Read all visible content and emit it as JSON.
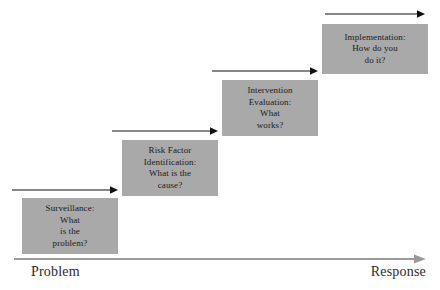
{
  "diagram": {
    "type": "staircase-flow",
    "title": "",
    "box_fill_color": "#a9a9a9",
    "arrow_color": "#111111",
    "axis_color": "#9a9a9a",
    "steps": [
      {
        "id": "surveillance",
        "lines": [
          "Surveillance:",
          "What",
          "is the",
          "problem?"
        ],
        "order": 1
      },
      {
        "id": "risk-factor-identification",
        "lines": [
          "Risk Factor",
          "Identification:",
          "What is the",
          "cause?"
        ],
        "order": 2
      },
      {
        "id": "intervention-evaluation",
        "lines": [
          "Intervention",
          "Evaluation:",
          "What",
          "works?"
        ],
        "order": 3
      },
      {
        "id": "implementation",
        "lines": [
          "Implementation:",
          "How do you",
          "do it?"
        ],
        "order": 4
      }
    ],
    "axis": {
      "start_label": "Problem",
      "end_label": "Response"
    }
  }
}
